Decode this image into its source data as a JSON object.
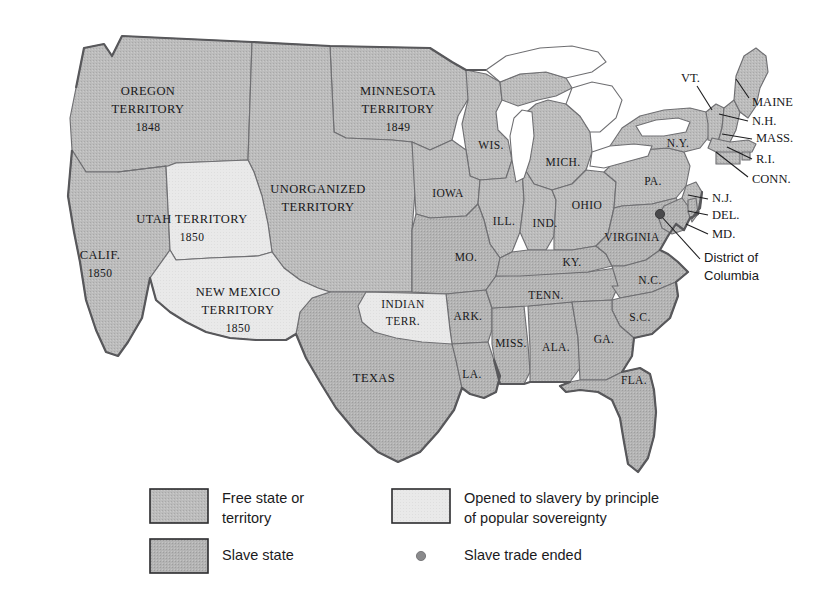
{
  "figure": {
    "kind": "historical-thematic-map"
  },
  "colors": {
    "free_fill": "#b9b9b9",
    "slave_fill": "#b0b0b0",
    "popular_sovereignty_fill": "#e8e8e8",
    "water_fill": "#ffffff",
    "border": "#6f6f72",
    "outline": "#58585b",
    "text": "#18181a",
    "background": "#ffffff",
    "dc_dot": "#4a4a4c"
  },
  "map": {
    "regions": [
      {
        "id": "oregon-territory",
        "name": "OREGON\nTERRITORY",
        "line1": "OREGON",
        "line2": "TERRITORY",
        "year": "1848",
        "category": "free",
        "label_x": 148,
        "label_y": 105
      },
      {
        "id": "utah-territory",
        "name": "UTAH TERRITORY",
        "line1": "UTAH TERRITORY",
        "line2": "",
        "year": "1850",
        "category": "popular_sovereignty",
        "label_x": 192,
        "label_y": 227
      },
      {
        "id": "new-mexico-territory",
        "name": "NEW MEXICO\nTERRITORY",
        "line1": "NEW MEXICO",
        "line2": "TERRITORY",
        "year": "1850",
        "category": "popular_sovereignty",
        "label_x": 238,
        "label_y": 303
      },
      {
        "id": "california",
        "name": "CALIF.",
        "line1": "CALIF.",
        "line2": "",
        "year": "1850",
        "category": "free",
        "label_x": 100,
        "label_y": 263
      },
      {
        "id": "minnesota-territory",
        "name": "MINNESOTA\nTERRITORY",
        "line1": "MINNESOTA",
        "line2": "TERRITORY",
        "year": "1849",
        "category": "free",
        "label_x": 398,
        "label_y": 105
      },
      {
        "id": "unorganized-territory",
        "name": "UNORGANIZED\nTERRITORY",
        "line1": "UNORGANIZED",
        "line2": "TERRITORY",
        "year": "",
        "category": "free",
        "label_x": 318,
        "label_y": 196
      },
      {
        "id": "indian-territory",
        "name": "INDIAN\nTERR.",
        "line1": "INDIAN",
        "line2": "TERR.",
        "year": "",
        "category": "popular_sovereignty",
        "label_x": 403,
        "label_y": 311
      },
      {
        "id": "texas",
        "name": "TEXAS",
        "line1": "TEXAS",
        "line2": "",
        "year": "",
        "category": "slave",
        "label_x": 374,
        "label_y": 379
      },
      {
        "id": "wisconsin",
        "name": "WIS.",
        "line1": "WIS.",
        "line2": "",
        "year": "",
        "category": "free",
        "label_x": 491,
        "label_y": 146
      },
      {
        "id": "michigan",
        "name": "MICH.",
        "line1": "MICH.",
        "line2": "",
        "year": "",
        "category": "free",
        "label_x": 563,
        "label_y": 163
      },
      {
        "id": "iowa",
        "name": "IOWA",
        "line1": "IOWA",
        "line2": "",
        "year": "",
        "category": "free",
        "label_x": 448,
        "label_y": 194
      },
      {
        "id": "illinois",
        "name": "ILL.",
        "line1": "ILL.",
        "line2": "",
        "year": "",
        "category": "free",
        "label_x": 504,
        "label_y": 222
      },
      {
        "id": "indiana",
        "name": "IND.",
        "line1": "IND.",
        "line2": "",
        "year": "",
        "category": "free",
        "label_x": 545,
        "label_y": 224
      },
      {
        "id": "ohio",
        "name": "OHIO",
        "line1": "OHIO",
        "line2": "",
        "year": "",
        "category": "free",
        "label_x": 587,
        "label_y": 206
      },
      {
        "id": "missouri",
        "name": "MO.",
        "line1": "MO.",
        "line2": "",
        "year": "",
        "category": "slave",
        "label_x": 466,
        "label_y": 258
      },
      {
        "id": "kentucky",
        "name": "KY.",
        "line1": "KY.",
        "line2": "",
        "year": "",
        "category": "slave",
        "label_x": 572,
        "label_y": 263
      },
      {
        "id": "virginia",
        "name": "VIRGINIA",
        "line1": "VIRGINIA",
        "line2": "",
        "year": "",
        "category": "slave",
        "label_x": 632,
        "label_y": 238
      },
      {
        "id": "tennessee",
        "name": "TENN.",
        "line1": "TENN.",
        "line2": "",
        "year": "",
        "category": "slave",
        "label_x": 546,
        "label_y": 296
      },
      {
        "id": "arkansas",
        "name": "ARK.",
        "line1": "ARK.",
        "line2": "",
        "year": "",
        "category": "slave",
        "label_x": 468,
        "label_y": 317
      },
      {
        "id": "north-carolina",
        "name": "N.C.",
        "line1": "N.C.",
        "line2": "",
        "year": "",
        "category": "slave",
        "label_x": 650,
        "label_y": 281
      },
      {
        "id": "south-carolina",
        "name": "S.C.",
        "line1": "S.C.",
        "line2": "",
        "year": "",
        "category": "slave",
        "label_x": 640,
        "label_y": 318
      },
      {
        "id": "mississippi",
        "name": "MISS.",
        "line1": "MISS.",
        "line2": "",
        "year": "",
        "category": "slave",
        "label_x": 511,
        "label_y": 344
      },
      {
        "id": "alabama",
        "name": "ALA.",
        "line1": "ALA.",
        "line2": "",
        "year": "",
        "category": "slave",
        "label_x": 556,
        "label_y": 348
      },
      {
        "id": "georgia",
        "name": "GA.",
        "line1": "GA.",
        "line2": "",
        "year": "",
        "category": "slave",
        "label_x": 604,
        "label_y": 340
      },
      {
        "id": "louisiana",
        "name": "LA.",
        "line1": "LA.",
        "line2": "",
        "year": "",
        "category": "slave",
        "label_x": 472,
        "label_y": 375
      },
      {
        "id": "florida",
        "name": "FLA.",
        "line1": "FLA.",
        "line2": "",
        "year": "",
        "category": "slave",
        "label_x": 634,
        "label_y": 381
      },
      {
        "id": "pennsylvania",
        "name": "PA.",
        "line1": "PA.",
        "line2": "",
        "year": "",
        "category": "free",
        "label_x": 653,
        "label_y": 182
      },
      {
        "id": "new-york",
        "name": "N.Y.",
        "line1": "N.Y.",
        "line2": "",
        "year": "",
        "category": "free",
        "label_x": 678,
        "label_y": 144
      }
    ],
    "callouts": [
      {
        "id": "vermont",
        "label": "VT.",
        "x": 681,
        "y": 79,
        "anchor": "end",
        "lx1": 697,
        "ly1": 86,
        "lx2": 712,
        "ly2": 110,
        "font": "serif"
      },
      {
        "id": "maine",
        "label": "MAINE",
        "x": 752,
        "y": 103,
        "anchor": "start",
        "lx1": 749,
        "ly1": 98,
        "lx2": 736,
        "ly2": 79,
        "font": "serif"
      },
      {
        "id": "new-hampshire",
        "label": "N.H.",
        "x": 752,
        "y": 122,
        "anchor": "start",
        "lx1": 748,
        "ly1": 121,
        "lx2": 719,
        "ly2": 114,
        "font": "serif"
      },
      {
        "id": "massachusetts",
        "label": "MASS.",
        "x": 756,
        "y": 139,
        "anchor": "start",
        "lx1": 752,
        "ly1": 139,
        "lx2": 722,
        "ly2": 134,
        "font": "serif"
      },
      {
        "id": "rhode-island",
        "label": "R.I.",
        "x": 756,
        "y": 160,
        "anchor": "start",
        "lx1": 752,
        "ly1": 159,
        "lx2": 727,
        "ly2": 147,
        "font": "serif"
      },
      {
        "id": "connecticut",
        "label": "CONN.",
        "x": 752,
        "y": 180,
        "anchor": "start",
        "lx1": 748,
        "ly1": 177,
        "lx2": 716,
        "ly2": 152,
        "font": "serif"
      },
      {
        "id": "new-jersey",
        "label": "N.J.",
        "x": 712,
        "y": 199,
        "anchor": "start",
        "lx1": 708,
        "ly1": 199,
        "lx2": 688,
        "ly2": 195,
        "font": "serif"
      },
      {
        "id": "delaware",
        "label": "DEL.",
        "x": 712,
        "y": 216,
        "anchor": "start",
        "lx1": 708,
        "ly1": 215,
        "lx2": 688,
        "ly2": 211,
        "font": "serif"
      },
      {
        "id": "maryland",
        "label": "MD.",
        "x": 712,
        "y": 235,
        "anchor": "start",
        "lx1": 708,
        "ly1": 234,
        "lx2": 686,
        "ly2": 224,
        "font": "serif"
      },
      {
        "id": "district-of-columbia",
        "label": "District of",
        "label2": "Columbia",
        "x": 704,
        "y": 262,
        "anchor": "start",
        "lx1": 700,
        "ly1": 259,
        "lx2": 661,
        "ly2": 216,
        "font": "sans"
      }
    ],
    "dc_marker": {
      "cx": 660,
      "cy": 214,
      "r": 4.6
    }
  },
  "legend": {
    "items": [
      {
        "id": "free-state",
        "swatch": "free",
        "line1": "Free state or",
        "line2": "territory"
      },
      {
        "id": "slave-state",
        "swatch": "slave",
        "line1": "Slave state",
        "line2": ""
      },
      {
        "id": "popular-sovereignty",
        "swatch": "popular_sovereignty",
        "line1": "Opened to slavery by principle",
        "line2": "of popular sovereignty"
      },
      {
        "id": "slave-trade-ended",
        "swatch": "dot",
        "line1": "Slave trade ended",
        "line2": ""
      }
    ]
  }
}
